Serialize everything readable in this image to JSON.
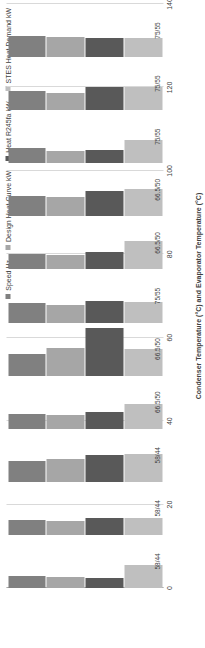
{
  "chart_data": {
    "type": "bar",
    "orientation": "vertical-rotated",
    "title": "",
    "xlabel": "Condenser Temperature (°C) and Evaporator Temperature (°C)",
    "ylabel": "",
    "ylim": [
      0,
      140
    ],
    "yticks": [
      0,
      20,
      40,
      60,
      80,
      100,
      120,
      140
    ],
    "grid": true,
    "legend_position": "top-right",
    "categories": [
      "58/44",
      "58/44",
      "58/44",
      "66.5/50",
      "66.5/50",
      "75/55",
      "66.5/50",
      "66.5/50",
      "75/55",
      "75/55",
      "75/55"
    ],
    "series": [
      {
        "name": "Speed Hz",
        "color": "#808080",
        "values": [
          31,
          40,
          56,
          40,
          57,
          51,
          42,
          53,
          40,
          51,
          55
        ]
      },
      {
        "name": "Design Heat Curve kW",
        "color": "#a6a6a6",
        "values": [
          28,
          37,
          60,
          37,
          72,
          46,
          39,
          50,
          33,
          46,
          52
        ]
      },
      {
        "name": "Heat R245fa kW",
        "color": "#595959",
        "values": [
          27,
          45,
          72,
          43,
          125,
          57,
          47,
          68,
          36,
          60,
          50
        ]
      },
      {
        "name": "STES Heat Demand kW",
        "color": "#bfbfbf",
        "values": [
          60,
          45,
          73,
          64,
          71,
          54,
          74,
          71,
          60,
          62,
          50
        ]
      }
    ]
  },
  "legend": {
    "items": [
      {
        "label": "Speed Hz"
      },
      {
        "label": "Design Heat Curve kW"
      },
      {
        "label": "Heat R245fa kW"
      },
      {
        "label": "STES Heat Demand kW"
      }
    ]
  },
  "axis": {
    "value_ticks": [
      "0",
      "20",
      "40",
      "60",
      "80",
      "100",
      "120",
      "140"
    ],
    "category_labels": [
      "58/44",
      "58/44",
      "58/44",
      "66.5/50",
      "66.5/50",
      "75/55",
      "66.5/50",
      "66.5/50",
      "75/55",
      "75/55",
      "75/55"
    ],
    "title": "Condenser Temperature (°C) and Evaporator Temperature (°C)"
  }
}
